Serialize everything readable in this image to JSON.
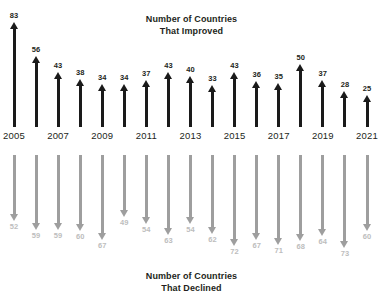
{
  "chart_data": {
    "type": "bar",
    "title": "",
    "title_improved_line1": "Number of Countries",
    "title_improved_line2": "That Improved",
    "title_declined_line1": "Number of Countries",
    "title_declined_line2": "That Declined",
    "xlabel": "",
    "ylabel": "",
    "grid": false,
    "legend": "none",
    "categories": [
      "2005",
      "2006",
      "2007",
      "2008",
      "2009",
      "2010",
      "2011",
      "2012",
      "2013",
      "2014",
      "2015",
      "2016",
      "2017",
      "2018",
      "2019",
      "2020",
      "2021"
    ],
    "tick_labels_shown": [
      "2005",
      "",
      "2007",
      "",
      "2009",
      "",
      "2011",
      "",
      "2013",
      "",
      "2015",
      "",
      "2017",
      "",
      "2019",
      "",
      "2021"
    ],
    "series": [
      {
        "name": "Number of Countries That Improved",
        "direction": "up",
        "color": "#1a1a1a",
        "values": [
          83,
          56,
          43,
          38,
          34,
          34,
          37,
          43,
          40,
          33,
          43,
          36,
          35,
          50,
          37,
          28,
          25
        ]
      },
      {
        "name": "Number of Countries That Declined",
        "direction": "down",
        "color": "#9e9e9e",
        "values": [
          52,
          59,
          59,
          60,
          67,
          49,
          54,
          63,
          54,
          62,
          72,
          67,
          71,
          68,
          64,
          73,
          60
        ]
      }
    ]
  }
}
